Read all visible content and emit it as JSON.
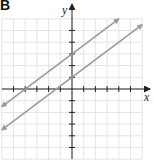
{
  "panel_label": "B",
  "axes": {
    "x_label": "x",
    "y_label": "y"
  },
  "colors": {
    "grid": "#e4e4e4",
    "axis": "#222222",
    "line": "#9a9a9a"
  },
  "chart_data": {
    "type": "line",
    "title": "",
    "xlabel": "x",
    "ylabel": "y",
    "xlim": [
      -6,
      6
    ],
    "ylim": [
      -6,
      6
    ],
    "grid": true,
    "tick_spacing": 1,
    "tick_labels": false,
    "series": [
      {
        "name": "line-1",
        "equation": "y = 3/4 x + 3",
        "slope": 0.75,
        "intercept": 3,
        "x": [
          -6,
          4
        ],
        "y": [
          -1.5,
          6
        ]
      },
      {
        "name": "line-2",
        "equation": "y = 3/4 x + 1",
        "slope": 0.75,
        "intercept": 1,
        "x": [
          -6,
          6
        ],
        "y": [
          -3.5,
          5.5
        ]
      }
    ],
    "annotations": [
      "parallel lines with arrowheads at both ends"
    ]
  }
}
